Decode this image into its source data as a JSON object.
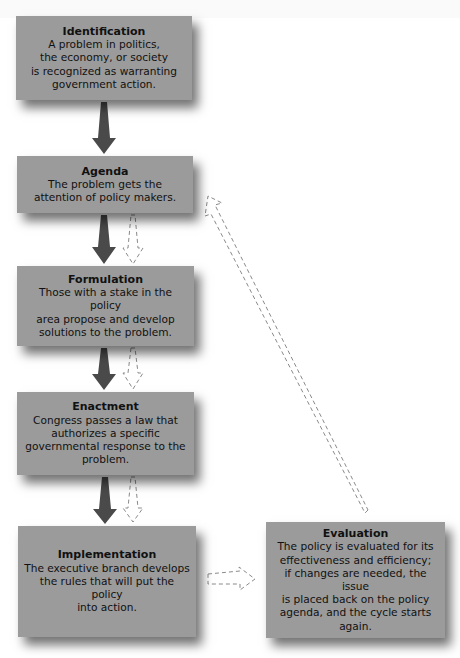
{
  "diagram": {
    "type": "flowchart",
    "colors": {
      "box_fill": "#9b9b9b",
      "solid_arrow": "#4a4a4a",
      "dashed_arrow": "#8a8a8a",
      "background": "#ffffff"
    },
    "stages": [
      {
        "id": "identification",
        "title": "Identification",
        "description": "A problem in politics,\nthe economy, or society\nis recognized as warranting\ngovernment action."
      },
      {
        "id": "agenda",
        "title": "Agenda",
        "description": "The problem gets the\nattention of policy makers."
      },
      {
        "id": "formulation",
        "title": "Formulation",
        "description": "Those with a stake in the policy\narea propose and develop\nsolutions to the problem."
      },
      {
        "id": "enactment",
        "title": "Enactment",
        "description": "Congress passes a law that\nauthorizes a specific\ngovernmental response to the\nproblem."
      },
      {
        "id": "implementation",
        "title": "Implementation",
        "description": "The executive branch develops\nthe rules that will put the policy\ninto action."
      },
      {
        "id": "evaluation",
        "title": "Evaluation",
        "description": "The policy is evaluated for its\neffectiveness and efficiency;\nif changes are needed, the issue\nis placed back on the policy\nagenda, and the cycle starts\nagain."
      }
    ],
    "connections": [
      {
        "from": "identification",
        "to": "agenda",
        "style": "solid"
      },
      {
        "from": "agenda",
        "to": "formulation",
        "style": "solid"
      },
      {
        "from": "agenda",
        "to": "formulation",
        "style": "dashed"
      },
      {
        "from": "formulation",
        "to": "enactment",
        "style": "solid"
      },
      {
        "from": "formulation",
        "to": "enactment",
        "style": "dashed"
      },
      {
        "from": "enactment",
        "to": "implementation",
        "style": "solid"
      },
      {
        "from": "enactment",
        "to": "implementation",
        "style": "dashed"
      },
      {
        "from": "implementation",
        "to": "evaluation",
        "style": "dashed"
      },
      {
        "from": "evaluation",
        "to": "agenda",
        "style": "dashed"
      }
    ]
  }
}
